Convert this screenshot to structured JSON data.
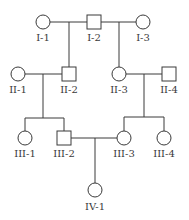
{
  "diagram": {
    "type": "pedigree",
    "colors": {
      "stroke": "#3a3a3a",
      "fill": "#ffffff",
      "text": "#3a3a3a"
    },
    "individuals": [
      {
        "id": "I-1",
        "label": "I-1",
        "sex": "female",
        "cx": 43,
        "cy": 22
      },
      {
        "id": "I-2",
        "label": "I-2",
        "sex": "male",
        "cx": 94,
        "cy": 22
      },
      {
        "id": "I-3",
        "label": "I-3",
        "sex": "female",
        "cx": 143,
        "cy": 22
      },
      {
        "id": "II-1",
        "label": "II-1",
        "sex": "female",
        "cx": 18,
        "cy": 74
      },
      {
        "id": "II-2",
        "label": "II-2",
        "sex": "male",
        "cx": 69,
        "cy": 74
      },
      {
        "id": "II-3",
        "label": "II-3",
        "sex": "female",
        "cx": 119,
        "cy": 74
      },
      {
        "id": "II-4",
        "label": "II-4",
        "sex": "male",
        "cx": 169,
        "cy": 74
      },
      {
        "id": "III-1",
        "label": "III-1",
        "sex": "female",
        "cx": 25,
        "cy": 138
      },
      {
        "id": "III-2",
        "label": "III-2",
        "sex": "male",
        "cx": 64,
        "cy": 138
      },
      {
        "id": "III-3",
        "label": "III-3",
        "sex": "female",
        "cx": 124,
        "cy": 138
      },
      {
        "id": "III-4",
        "label": "III-4",
        "sex": "female",
        "cx": 164,
        "cy": 138
      },
      {
        "id": "IV-1",
        "label": "IV-1",
        "sex": "female",
        "cx": 95,
        "cy": 190
      }
    ],
    "matings": [
      {
        "partners": [
          "I-1",
          "I-2"
        ],
        "children": [
          "II-2"
        ]
      },
      {
        "partners": [
          "I-2",
          "I-3"
        ],
        "children": [
          "II-3"
        ]
      },
      {
        "partners": [
          "II-1",
          "II-2"
        ],
        "children": [
          "III-1",
          "III-2"
        ]
      },
      {
        "partners": [
          "II-3",
          "II-4"
        ],
        "children": [
          "III-3",
          "III-4"
        ]
      },
      {
        "partners": [
          "III-2",
          "III-3"
        ],
        "children": [
          "IV-1"
        ]
      }
    ]
  }
}
